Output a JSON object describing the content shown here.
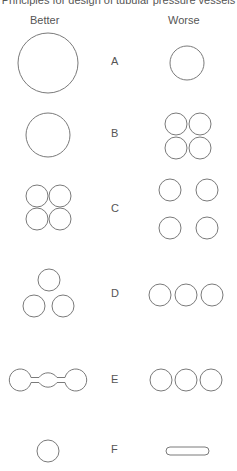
{
  "title": "Principles for design of tubular pressure vessels",
  "columns": {
    "better": "Better",
    "worse": "Worse"
  },
  "rows": [
    {
      "label": "A",
      "y": 57
    },
    {
      "label": "B",
      "y": 129
    },
    {
      "label": "C",
      "y": 203
    },
    {
      "label": "D",
      "y": 288
    },
    {
      "label": "E",
      "y": 374
    },
    {
      "label": "F",
      "y": 444
    }
  ],
  "stroke_color": "#7a7a7a",
  "text_color": "#555555"
}
